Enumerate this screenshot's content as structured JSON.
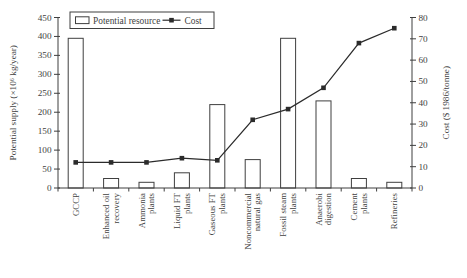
{
  "figure": {
    "background": "#ffffff",
    "ink": "#3f3f3f",
    "line_color": "#2b2b2b",
    "bar_fill": "#ffffff"
  },
  "chart_data": {
    "type": "bar+line",
    "title": "",
    "categories": [
      "GCCP",
      "Enhanced oil\nrecovery",
      "Ammonia\nplants",
      "Liquid FT\nplants",
      "Gaseous FT\nplants",
      "Noncommercial\nnatural gas",
      "Fossil steam\nplants",
      "Anaerobi\ndigestion",
      "Cement\nplants",
      "Refineries"
    ],
    "series": [
      {
        "name": "Potential resource",
        "type": "bar",
        "axis": "left",
        "values": [
          395,
          25,
          15,
          40,
          220,
          75,
          395,
          230,
          25,
          15
        ]
      },
      {
        "name": "Cost",
        "type": "line",
        "axis": "right",
        "marker": "square",
        "values": [
          12,
          12,
          12,
          14,
          13,
          32,
          37,
          47,
          68,
          75
        ]
      }
    ],
    "left_axis": {
      "label": "Potential supply (×10⁶ kg/year)",
      "range": [
        0,
        450
      ],
      "ticks": [
        0,
        50,
        100,
        150,
        200,
        250,
        300,
        350,
        400,
        450
      ]
    },
    "right_axis": {
      "label": "Cost ($ 1986/tonne)",
      "range": [
        0,
        80
      ],
      "ticks": [
        0,
        10,
        20,
        30,
        40,
        50,
        60,
        70,
        80
      ]
    },
    "legend_position": "top",
    "grid": false
  }
}
